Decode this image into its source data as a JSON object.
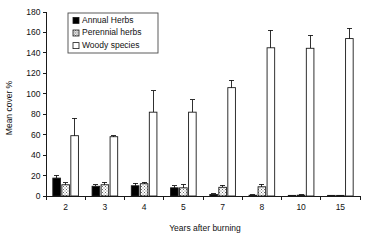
{
  "chart_data": {
    "type": "bar",
    "title": "",
    "subtitle": "",
    "xlabel": "Years after burning",
    "ylabel": "Mean cover %",
    "categories": [
      "2",
      "3",
      "4",
      "5",
      "7",
      "8",
      "10",
      "15"
    ],
    "ylim": [
      0,
      180
    ],
    "ytick_values": [
      0,
      20,
      40,
      60,
      80,
      100,
      120,
      140,
      160,
      180
    ],
    "ytick_labels": [
      "0",
      "20",
      "40",
      "60",
      "80",
      "100",
      "120",
      "140",
      "160",
      "180"
    ],
    "grid": false,
    "legend_position": "top-left-inside",
    "series": [
      {
        "name": "Annual Herbs",
        "fill": "#000000",
        "pattern": "solid",
        "values": [
          17.5,
          9.5,
          10.0,
          8.0,
          1.5,
          0.7,
          0.4,
          0.2
        ],
        "errors": [
          3.0,
          1.5,
          2.5,
          2.0,
          0.8,
          0.5,
          0.4,
          0.2
        ]
      },
      {
        "name": "Perennial herbs",
        "fill": "#ffffff",
        "pattern": "dotted",
        "values": [
          11.0,
          11.0,
          12.0,
          8.0,
          8.5,
          9.0,
          0.8,
          0.3
        ],
        "errors": [
          2.0,
          2.5,
          1.5,
          3.5,
          2.0,
          2.5,
          0.5,
          0.3
        ]
      },
      {
        "name": "Woody species",
        "fill": "#ffffff",
        "pattern": "open",
        "values": [
          59.0,
          58.0,
          82.0,
          82.0,
          106.0,
          145.0,
          144.5,
          154.0
        ],
        "errors": [
          17.0,
          1.0,
          21.0,
          12.0,
          7.0,
          17.0,
          13.0,
          10.0
        ]
      }
    ]
  },
  "legend": {
    "entries": [
      {
        "label": "Annual Herbs",
        "marker": "filled-square-marker"
      },
      {
        "label": "Perennial herbs",
        "marker": "dotted-square-marker"
      },
      {
        "label": "Woody species",
        "marker": "open-square-marker"
      }
    ]
  },
  "axes": {
    "y_title": "Mean cover %",
    "x_title": "Years after burning"
  }
}
